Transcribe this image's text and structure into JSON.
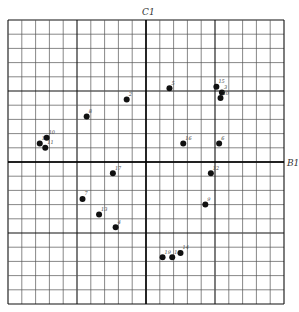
{
  "chart_data": {
    "type": "scatter",
    "title": "",
    "xlabel": "B1",
    "ylabel": "C1",
    "xlim": [
      -10,
      10
    ],
    "ylim": [
      -10,
      10
    ],
    "grid": true,
    "grid_cells": 20,
    "major_every": 5,
    "legend": null,
    "points": [
      {
        "label": "1",
        "x": -7.7,
        "y": 1.3
      },
      {
        "label": "10",
        "x": -7.2,
        "y": 1.7
      },
      {
        "label": "11",
        "x": -7.3,
        "y": 1.0
      },
      {
        "label": "8",
        "x": -4.3,
        "y": 3.2
      },
      {
        "label": "2",
        "x": -1.4,
        "y": 4.4
      },
      {
        "label": "5",
        "x": 1.7,
        "y": 5.2
      },
      {
        "label": "15",
        "x": 5.1,
        "y": 5.3
      },
      {
        "label": "3",
        "x": 5.5,
        "y": 4.9
      },
      {
        "label": "20",
        "x": 5.4,
        "y": 4.5
      },
      {
        "label": "16",
        "x": 2.7,
        "y": 1.3
      },
      {
        "label": "6",
        "x": 5.3,
        "y": 1.3
      },
      {
        "label": "17",
        "x": -2.4,
        "y": -0.8
      },
      {
        "label": "12",
        "x": 4.7,
        "y": -0.8
      },
      {
        "label": "9",
        "x": 4.3,
        "y": -3.0
      },
      {
        "label": "7",
        "x": -4.6,
        "y": -2.6
      },
      {
        "label": "13",
        "x": -3.4,
        "y": -3.7
      },
      {
        "label": "4",
        "x": -2.2,
        "y": -4.6
      },
      {
        "label": "19",
        "x": 1.2,
        "y": -6.7
      },
      {
        "label": "18",
        "x": 1.9,
        "y": -6.7
      },
      {
        "label": "14",
        "x": 2.5,
        "y": -6.4
      }
    ]
  },
  "axes": {
    "x_axis_label": "B1",
    "y_axis_label": "C1"
  },
  "colors": {
    "grid_minor": "#555555",
    "grid_major": "#111111",
    "point": "#111111"
  }
}
